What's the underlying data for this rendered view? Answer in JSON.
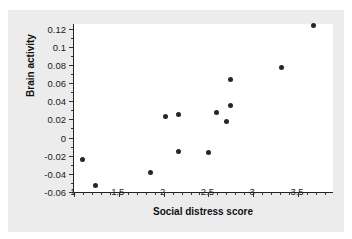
{
  "chart_data": {
    "type": "scatter",
    "title": "",
    "xlabel": "Social distress score",
    "ylabel": "Brain activity",
    "xlim": [
      1.0,
      3.89
    ],
    "ylim": [
      -0.06,
      0.125
    ],
    "grid": false,
    "legend": null,
    "xticks": [
      "1",
      "1.5",
      "2",
      "2.5",
      "3",
      "3.5"
    ],
    "xtick_values": [
      1,
      1.5,
      2,
      2.5,
      3,
      3.5
    ],
    "xtick_minor_step": 0.1,
    "yticks": [
      "0.12",
      "0.1",
      "0.08",
      "0.06",
      "0.04",
      "0.02",
      "0",
      "-0.02",
      "-0.04",
      "-0.06"
    ],
    "ytick_values": [
      0.12,
      0.1,
      0.08,
      0.06,
      0.04,
      0.02,
      0,
      -0.02,
      -0.04,
      -0.06
    ],
    "ytick_minor_step": 0.01,
    "marker": "filled-circle",
    "marker_color": "#262626",
    "points": [
      {
        "x": 1.09,
        "y": -0.024
      },
      {
        "x": 1.24,
        "y": -0.053
      },
      {
        "x": 1.85,
        "y": -0.038
      },
      {
        "x": 2.02,
        "y": 0.023
      },
      {
        "x": 2.17,
        "y": 0.025
      },
      {
        "x": 2.17,
        "y": -0.015
      },
      {
        "x": 2.5,
        "y": -0.016
      },
      {
        "x": 2.59,
        "y": 0.028
      },
      {
        "x": 2.7,
        "y": 0.018
      },
      {
        "x": 2.75,
        "y": 0.064
      },
      {
        "x": 2.75,
        "y": 0.035
      },
      {
        "x": 3.32,
        "y": 0.077
      },
      {
        "x": 3.67,
        "y": 0.123
      }
    ]
  },
  "figure": {
    "background_color": "#ececec",
    "plot_background_color": "#ffffff",
    "axis_color": "#222222"
  }
}
